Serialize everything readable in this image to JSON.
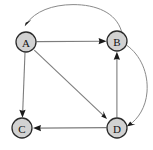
{
  "figure": {
    "background_color": "#ffffff",
    "width": 153,
    "height": 150
  },
  "graph": {
    "type": "directed-graph",
    "node_fill_color": "#d2d2d2",
    "node_stroke_color": "#2b2b2b",
    "edge_color": "#7d7d7d",
    "arrow_color": "#1a1a1a",
    "node_radius": 10,
    "nodes": [
      {
        "id": "A",
        "label": "A",
        "x": 26,
        "y": 42
      },
      {
        "id": "B",
        "label": "B",
        "x": 117,
        "y": 41
      },
      {
        "id": "C",
        "label": "C",
        "x": 22,
        "y": 128
      },
      {
        "id": "D",
        "label": "D",
        "x": 117,
        "y": 128
      }
    ],
    "edges": [
      {
        "from": "A",
        "to": "B",
        "shape": "straight"
      },
      {
        "from": "B",
        "to": "A",
        "shape": "curved-top"
      },
      {
        "from": "A",
        "to": "C",
        "shape": "straight"
      },
      {
        "from": "A",
        "to": "D",
        "shape": "straight-diagonal"
      },
      {
        "from": "D",
        "to": "B",
        "shape": "straight"
      },
      {
        "from": "B",
        "to": "D",
        "shape": "curved-right"
      },
      {
        "from": "D",
        "to": "C",
        "shape": "straight"
      }
    ]
  }
}
